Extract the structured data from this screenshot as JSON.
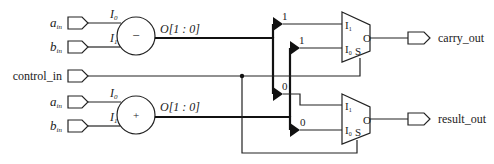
{
  "diagram": {
    "type": "circuit-schematic",
    "inputs": {
      "sub_a": {
        "label": "a",
        "sub": "in"
      },
      "sub_b": {
        "label": "b",
        "sub": "in"
      },
      "control": {
        "label": "control_in"
      },
      "add_a": {
        "label": "a",
        "sub": "in"
      },
      "add_b": {
        "label": "b",
        "sub": "in"
      }
    },
    "subtractor": {
      "symbol": "−",
      "in0": {
        "label": "I",
        "sub": "0"
      },
      "in1": {
        "label": "I",
        "sub": "1"
      },
      "out": "O[1 : 0]"
    },
    "adder": {
      "symbol": "+",
      "in0": {
        "label": "I",
        "sub": "0"
      },
      "in1": {
        "label": "I",
        "sub": "1"
      },
      "out": "O[1 : 0]"
    },
    "bit_taps": {
      "sub_bit1": "1",
      "add_bit1": "1",
      "sub_bit0": "0",
      "add_bit0": "0"
    },
    "mux_carry": {
      "i1": {
        "label": "I",
        "sub": "1"
      },
      "i0": {
        "label": "I",
        "sub": "0"
      },
      "sel": "S",
      "out": "O"
    },
    "mux_result": {
      "i1": {
        "label": "I",
        "sub": "1"
      },
      "i0": {
        "label": "I",
        "sub": "0"
      },
      "sel": "S",
      "out": "O"
    },
    "outputs": {
      "carry": {
        "label": "carry_out"
      },
      "result": {
        "label": "result_out"
      }
    }
  }
}
